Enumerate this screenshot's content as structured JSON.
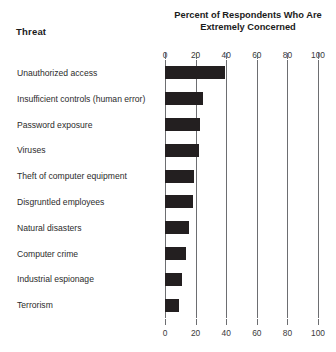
{
  "header": {
    "threat_label": "Threat",
    "title_line1": "Percent of Respondents Who Are",
    "title_line2": "Extremely Concerned"
  },
  "chart_data": {
    "type": "bar",
    "orientation": "horizontal",
    "title": "Percent of Respondents Who Are Extremely Concerned",
    "xlabel": "",
    "ylabel": "Threat",
    "xlim": [
      0,
      100
    ],
    "xticks": [
      0,
      20,
      40,
      60,
      80,
      100
    ],
    "tick_labels": [
      "0",
      "20",
      "40",
      "60",
      "80",
      "100"
    ],
    "grid": true,
    "grid_axis": "x",
    "legend": false,
    "axis_duplicated_top_and_bottom": true,
    "bar_color": "#231f20",
    "categories": [
      "Unauthorized access",
      "Insufficient controls (human error)",
      "Password exposure",
      "Viruses",
      "Theft of computer equipment",
      "Disgruntled employees",
      "Natural disasters",
      "Computer crime",
      "Industrial espionage",
      "Terrorism"
    ],
    "values": [
      39,
      25,
      23,
      22,
      19,
      18,
      16,
      14,
      11,
      9
    ]
  }
}
